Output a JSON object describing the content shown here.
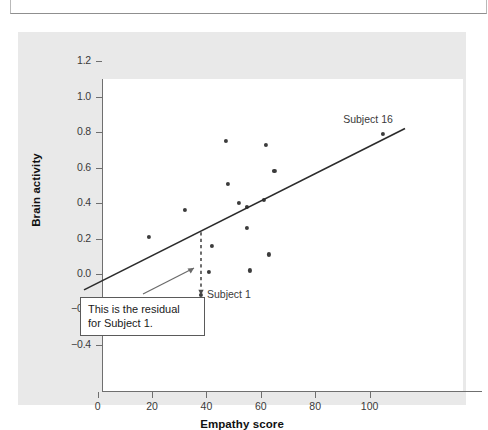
{
  "chart_data": {
    "type": "scatter",
    "title": "",
    "xlabel": "Empathy score",
    "ylabel": "Brain activity",
    "xlim": [
      -5,
      113
    ],
    "ylim": [
      -0.48,
      1.28
    ],
    "xticks": [
      "0",
      "20",
      "40",
      "60",
      "80",
      "100"
    ],
    "xtick_values": [
      0,
      20,
      40,
      60,
      80,
      100
    ],
    "yticks": [
      "1.2",
      "1.0",
      "0.8",
      "0.6",
      "0.4",
      "0.2",
      "0.0",
      "−0.2",
      "−0.4"
    ],
    "ytick_values": [
      1.2,
      1.0,
      0.8,
      0.6,
      0.4,
      0.2,
      0.0,
      -0.2,
      -0.4
    ],
    "grid": false,
    "legend": null,
    "points": [
      {
        "x": 19,
        "y": 0.21
      },
      {
        "x": 32,
        "y": 0.36
      },
      {
        "x": 38,
        "y": -0.12,
        "label": "Subject 1"
      },
      {
        "x": 41,
        "y": 0.01
      },
      {
        "x": 42,
        "y": 0.16
      },
      {
        "x": 47,
        "y": 0.75
      },
      {
        "x": 48,
        "y": 0.51
      },
      {
        "x": 52,
        "y": 0.4
      },
      {
        "x": 55,
        "y": 0.38
      },
      {
        "x": 55,
        "y": 0.26
      },
      {
        "x": 56,
        "y": 0.02
      },
      {
        "x": 61,
        "y": 0.42
      },
      {
        "x": 62,
        "y": 0.73
      },
      {
        "x": 63,
        "y": 0.11
      },
      {
        "x": 65,
        "y": 0.58
      },
      {
        "x": 105,
        "y": 0.79,
        "label": "Subject 16"
      }
    ],
    "regression_line": {
      "x_start": -5,
      "y_start": -0.09,
      "x_end": 113,
      "y_end": 0.82,
      "style": "solid"
    },
    "residual_segment": {
      "x": 38,
      "y_top": 0.235,
      "y_bottom": -0.115,
      "style": "dashed",
      "description": "vertical dashed residual for Subject 1"
    },
    "point_labels": [
      {
        "text": "Subject 1",
        "x": 38,
        "y": -0.12
      },
      {
        "text": "Subject 16",
        "x": 105,
        "y": 0.79
      }
    ],
    "annotations": [
      {
        "text": "This is the residual for Subject 1.",
        "line1": "This is the residual",
        "line2": "for Subject 1.",
        "type": "callout-box-with-arrow",
        "points_to": "residual-dashed-line"
      }
    ]
  },
  "axes": {
    "x_label": "Empathy score",
    "y_label": "Brain activity"
  },
  "colors": {
    "figure_background": "#e9e9e9",
    "panel_background": "#ffffff",
    "point": "#3c3c3c",
    "line": "#2b2b2b",
    "axis": "#6f6f6f",
    "text": "#1a1a1a"
  }
}
